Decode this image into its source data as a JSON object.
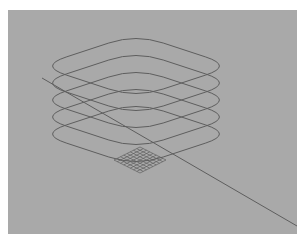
{
  "figure": {
    "background_color": "#a9a9a9",
    "line_color": "#5e5e5e",
    "frame": {
      "x": 8,
      "y": 10,
      "width": 289,
      "height": 224
    }
  },
  "loops": {
    "count": 5,
    "center_x": 136,
    "top_center_y": 66,
    "spacing_y": 17,
    "half_width": 97,
    "half_height": 32,
    "corner_radius": 0.28
  },
  "grid_patch": {
    "center": [
      140,
      160
    ],
    "rows": 8,
    "cols": 8,
    "half_width": 26,
    "half_height": 13
  },
  "diagonal_line": {
    "x1": 42,
    "y1": 78,
    "x2": 297,
    "y2": 226
  }
}
